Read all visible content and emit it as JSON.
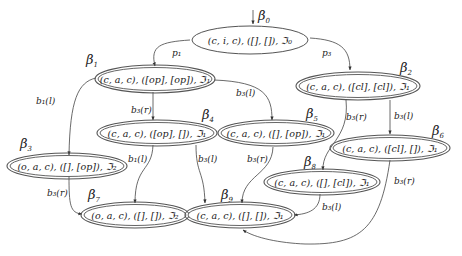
{
  "diagram": {
    "type": "state-transition-graph",
    "nodes": [
      {
        "id": "beta0",
        "name": "β",
        "sub": "0",
        "label": "(c, i, c), ([], []), ℑ₀",
        "initial": true,
        "double": false
      },
      {
        "id": "beta1",
        "name": "β",
        "sub": "1",
        "label": "(c, a, c), ([op], [op]), ℑ₁",
        "double": true
      },
      {
        "id": "beta2",
        "name": "β",
        "sub": "2",
        "label": "(c, a, c), ([cl], [cl]), ℑ₁",
        "double": true
      },
      {
        "id": "beta3",
        "name": "β",
        "sub": "3",
        "label": "(o, a, c), ([], [op]), ℑ₂",
        "double": true
      },
      {
        "id": "beta4",
        "name": "β",
        "sub": "4",
        "label": "(c, a, c), ([op], []), ℑ₁",
        "double": true
      },
      {
        "id": "beta5",
        "name": "β",
        "sub": "5",
        "label": "(c, a, c), ([], [op]), ℑ₁",
        "double": true
      },
      {
        "id": "beta6",
        "name": "β",
        "sub": "6",
        "label": "(c, a, c), ([cl], []), ℑ₁",
        "double": true
      },
      {
        "id": "beta7",
        "name": "β",
        "sub": "7",
        "label": "(o, a, c), ([], []), ℑ₂",
        "double": true
      },
      {
        "id": "beta8",
        "name": "β",
        "sub": "8",
        "label": "(c, a, c), ([], [cl]), ℑ₁",
        "double": true
      },
      {
        "id": "beta9",
        "name": "β",
        "sub": "9",
        "label": "(c, a, c), ([], []), ℑ₁",
        "double": true
      }
    ],
    "edges": [
      {
        "from": "beta0",
        "to": "beta1",
        "label": "p₁"
      },
      {
        "from": "beta0",
        "to": "beta2",
        "label": "p₃"
      },
      {
        "from": "beta1",
        "to": "beta3",
        "label": "b₁(l)"
      },
      {
        "from": "beta1",
        "to": "beta4",
        "label": "b₃(r)"
      },
      {
        "from": "beta1",
        "to": "beta5",
        "label": "b₃(l)"
      },
      {
        "from": "beta2",
        "to": "beta8",
        "label": "b₃(r)"
      },
      {
        "from": "beta2",
        "to": "beta6",
        "label": "b₃(l)"
      },
      {
        "from": "beta3",
        "to": "beta7",
        "label": "b₃(r)"
      },
      {
        "from": "beta4",
        "to": "beta7",
        "label": "b₁(l)"
      },
      {
        "from": "beta4",
        "to": "beta9",
        "label": "b₃(l)"
      },
      {
        "from": "beta5",
        "to": "beta9",
        "label": "b₃(r)"
      },
      {
        "from": "beta6",
        "to": "beta9",
        "label": "b₃(r)"
      },
      {
        "from": "beta8",
        "to": "beta9",
        "label": "b₃(l)"
      }
    ]
  },
  "labels": {
    "n0": "(c, i, c), ([], []), ℑ₀",
    "n1": "(c, a, c), ([op], [op]), ℑ₁",
    "n2": "(c, a, c), ([cl], [cl]), ℑ₁",
    "n3": "(o, a, c), ([], [op]), ℑ₂",
    "n4": "(c, a, c), ([op], []), ℑ₁",
    "n5": "(c, a, c), ([], [op]), ℑ₁",
    "n6": "(c, a, c), ([cl], []), ℑ₁",
    "n7": "(o, a, c), ([], []), ℑ₂",
    "n8": "(c, a, c), ([], [cl]), ℑ₁",
    "n9": "(c, a, c), ([], []), ℑ₁",
    "beta": "β",
    "s0": "0",
    "s1": "1",
    "s2": "2",
    "s3": "3",
    "s4": "4",
    "s5": "5",
    "s6": "6",
    "s7": "7",
    "s8": "8",
    "s9": "9",
    "e_p1": "p₁",
    "e_p3": "p₃",
    "e_1_3": "b₁(l)",
    "e_1_4": "b₃(r)",
    "e_1_5": "b₃(l)",
    "e_2_8": "b₃(r)",
    "e_2_6": "b₃(l)",
    "e_3_7": "b₃(r)",
    "e_4_7": "b₁(l)",
    "e_4_9": "b₃(l)",
    "e_5_9": "b₃(r)",
    "e_6_9": "b₃(r)",
    "e_8_9": "b₃(l)"
  }
}
